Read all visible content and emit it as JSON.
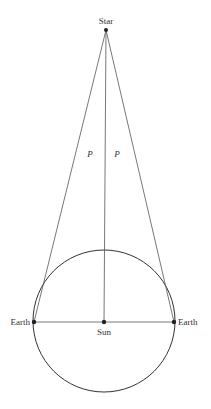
{
  "diagram": {
    "labels": {
      "star": "Star",
      "parallax_left": "P",
      "parallax_right": "P",
      "earth_left": "Earth",
      "earth_right": "Earth",
      "sun": "Sun"
    },
    "points": {
      "star": {
        "x": 106,
        "y": 30
      },
      "earth_left": {
        "x": 34,
        "y": 322
      },
      "earth_right": {
        "x": 174,
        "y": 322
      },
      "sun": {
        "x": 104,
        "y": 322
      }
    },
    "orbit": {
      "cx": 104,
      "cy": 321,
      "r": 71
    },
    "colors": {
      "line": "#555555",
      "orbit": "#333333",
      "dot": "#222222",
      "text": "#333333",
      "background": "#ffffff"
    }
  }
}
